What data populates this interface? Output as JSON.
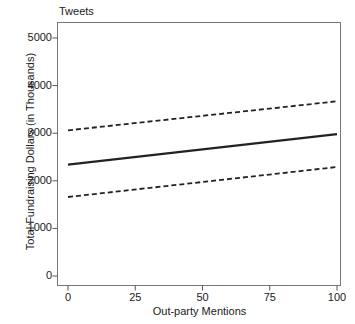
{
  "chart_data": {
    "type": "line",
    "title": "Tweets",
    "xlabel": "Out-party Mentions",
    "ylabel": "Total Fundraising Dollars (in Thousands)",
    "xlim": [
      0,
      100
    ],
    "ylim": [
      0,
      5000
    ],
    "grid": false,
    "legend": "none",
    "x_ticks": [
      0,
      25,
      50,
      75,
      100
    ],
    "x_tick_labels": [
      "0",
      "25",
      "50",
      "75",
      "100"
    ],
    "y_ticks": [
      0,
      1000,
      2000,
      3000,
      4000,
      5000
    ],
    "y_tick_labels": [
      "0",
      "1000",
      "2000",
      "3000",
      "4000",
      "5000"
    ],
    "x": [
      0,
      100
    ],
    "series": [
      {
        "name": "Predicted Fundraising",
        "style": "solid",
        "color": "#222222",
        "values": [
          2340,
          2980
        ]
      },
      {
        "name": "Upper 95% Confidence Interval",
        "style": "dashed",
        "color": "#222222",
        "values": [
          3060,
          3670
        ]
      },
      {
        "name": "Lower 95% Confidence Interval",
        "style": "dashed",
        "color": "#222222",
        "values": [
          1660,
          2290
        ]
      }
    ]
  },
  "colors": {
    "background": "#ffffff",
    "axis": "#555555",
    "line": "#222222",
    "text": "#1a1a1a"
  }
}
